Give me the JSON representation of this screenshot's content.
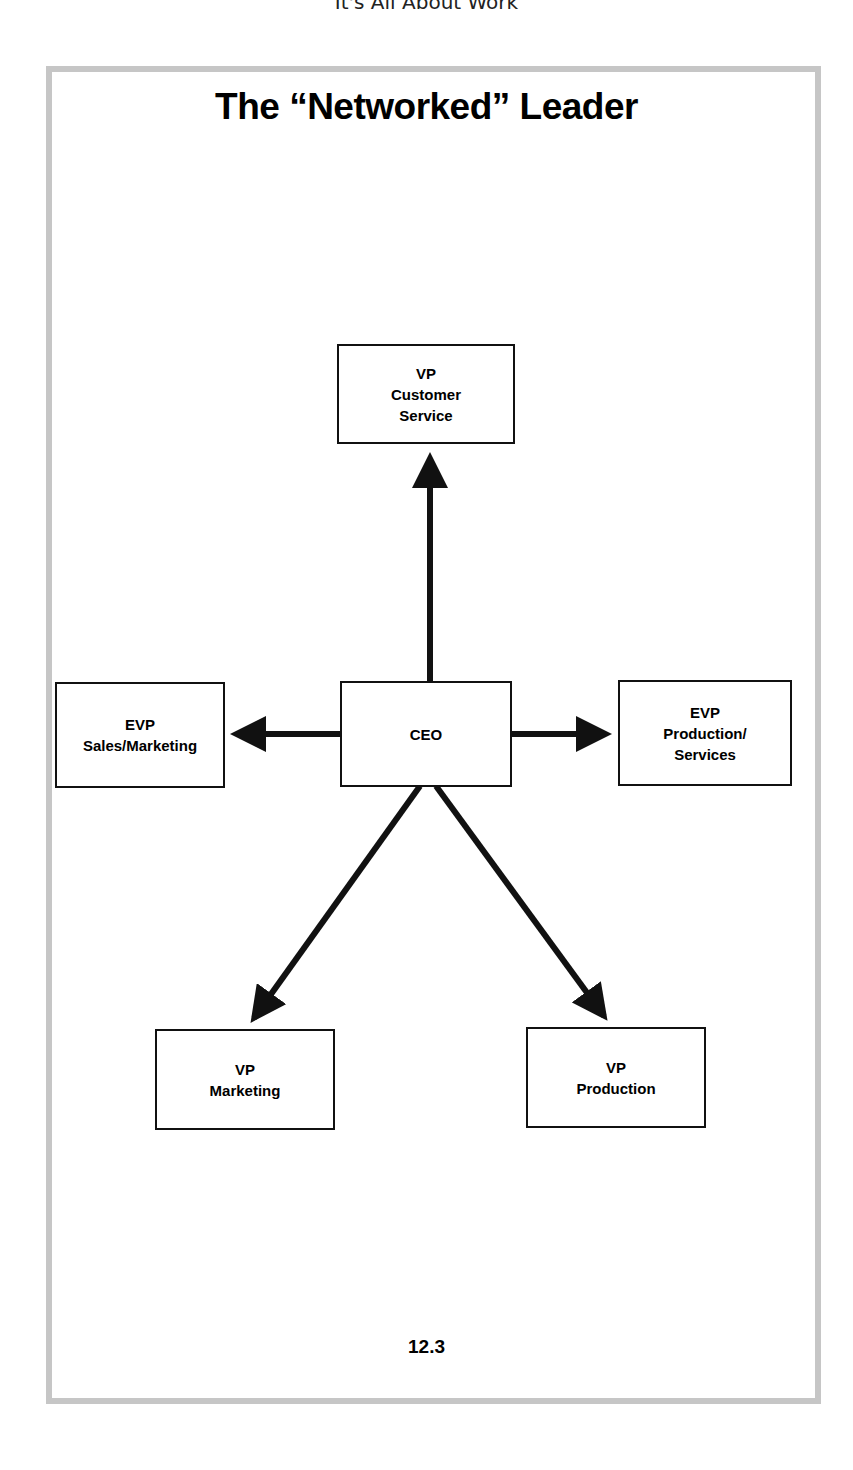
{
  "header": {
    "running_title": "It's All About Work"
  },
  "figure": {
    "title": "The “Networked” Leader",
    "page_number": "12.3"
  },
  "nodes": {
    "ceo": {
      "lines": [
        "CEO"
      ]
    },
    "vp_customer_service": {
      "lines": [
        "VP",
        "Customer",
        "Service"
      ]
    },
    "evp_sales_marketing": {
      "lines": [
        "EVP",
        "Sales/Marketing"
      ]
    },
    "evp_production_services": {
      "lines": [
        "EVP",
        "Production/",
        "Services"
      ]
    },
    "vp_marketing": {
      "lines": [
        "VP",
        "Marketing"
      ]
    },
    "vp_production": {
      "lines": [
        "VP",
        "Production"
      ]
    }
  },
  "edges": [
    {
      "from": "CEO",
      "to": "VP Customer Service"
    },
    {
      "from": "CEO",
      "to": "EVP Sales/Marketing"
    },
    {
      "from": "CEO",
      "to": "EVP Production/Services"
    },
    {
      "from": "CEO",
      "to": "VP Marketing"
    },
    {
      "from": "CEO",
      "to": "VP Production"
    }
  ],
  "colors": {
    "frame_border": "#c6c6c6",
    "stroke": "#111111",
    "background": "#ffffff"
  }
}
